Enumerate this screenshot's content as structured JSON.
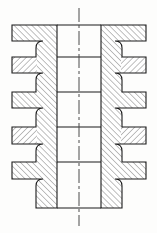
{
  "drawing": {
    "title": "finned-shaft-cross-section",
    "type": "engineering-section-view",
    "description": "Symmetric sectioned elevation of a finned cylindrical body with central through bore",
    "canvas": {
      "width": 157,
      "height": 233,
      "background": "#fdfdfc"
    },
    "style": {
      "outline_color": "#1a1a1a",
      "outline_width": 1.1,
      "hatch_color": "#2b2b2b",
      "hatch_width": 0.6,
      "hatch_spacing": 4.2,
      "centerline_color": "#4a4a4a",
      "centerline_width": 1.0,
      "bore_fill": "#ffffff",
      "section_fill": "#ffffff"
    },
    "geometry": {
      "axis_x": 79,
      "body_top_y": 25,
      "body_bottom_y": 208,
      "bore_left_x": 57,
      "bore_right_x": 101,
      "wall_left_x": 36,
      "wall_right_x": 122,
      "fin_left_x": 12,
      "fin_right_x": 146,
      "fillet_radius": 7
    },
    "centerline": {
      "name": "vertical-axis-centerline",
      "x": 79,
      "y_start": 8,
      "y_end": 226,
      "dash_pattern": "14,3,3,3"
    },
    "fins": [
      {
        "index": 1,
        "top_y": 25,
        "bottom_y": 41,
        "hatch_direction": "up-right",
        "label": "fin-1"
      },
      {
        "index": 2,
        "top_y": 57,
        "bottom_y": 73,
        "hatch_direction": "down-right",
        "label": "fin-2"
      },
      {
        "index": 3,
        "top_y": 92,
        "bottom_y": 108,
        "hatch_direction": "up-right",
        "label": "fin-3"
      },
      {
        "index": 4,
        "top_y": 127,
        "bottom_y": 144,
        "hatch_direction": "down-right",
        "label": "fin-4"
      },
      {
        "index": 5,
        "top_y": 162,
        "bottom_y": 179,
        "hatch_direction": "up-right",
        "label": "fin-5"
      }
    ],
    "section_lines": [
      {
        "name": "bore-line-1",
        "y": 57,
        "x1": 57,
        "x2": 101
      },
      {
        "name": "bore-line-2",
        "y": 92,
        "x1": 57,
        "x2": 101
      },
      {
        "name": "bore-line-3",
        "y": 127,
        "x1": 57,
        "x2": 101
      },
      {
        "name": "bore-line-4",
        "y": 162,
        "x1": 57,
        "x2": 101
      }
    ],
    "fin_count": 5,
    "symmetry": "bilateral-vertical"
  }
}
